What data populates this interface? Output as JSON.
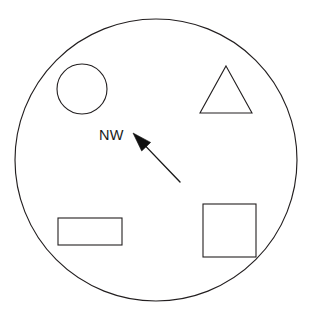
{
  "diagram": {
    "canvas": {
      "width": 313,
      "height": 322,
      "background": "#ffffff"
    },
    "stroke_color": "#231f20",
    "arrow_color": "#101010",
    "text_color": "#1a1a1a",
    "boundary": {
      "name": "outer-circle",
      "shape": "circle",
      "cx": 156,
      "cy": 160,
      "r": 141
    },
    "shapes": [
      {
        "id": "circle",
        "label": "circle",
        "shape": "circle",
        "cx": 82,
        "cy": 89,
        "r": 25
      },
      {
        "id": "triangle",
        "label": "triangle",
        "shape": "triangle",
        "points": "226,66 252,113 200,113"
      },
      {
        "id": "rectangle",
        "label": "rectangle",
        "shape": "rect",
        "x": 58,
        "y": 218,
        "width": 64,
        "height": 27
      },
      {
        "id": "square",
        "label": "square",
        "shape": "rect",
        "x": 203,
        "y": 204,
        "width": 53,
        "height": 53
      }
    ],
    "arrow": {
      "id": "nw-arrow",
      "label": "northwest-arrow",
      "direction": "NW",
      "tip_x": 133,
      "tip_y": 133,
      "tail_x": 180,
      "tail_y": 182,
      "shaft_path": "M 180 182 L 142 143",
      "head_points": "133,133 147,140 141,147"
    },
    "label": {
      "id": "nw-label",
      "text": "NW",
      "x": 99,
      "y": 140
    }
  }
}
